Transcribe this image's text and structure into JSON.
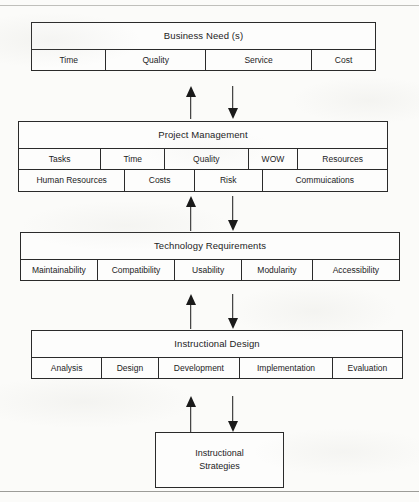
{
  "diagram": {
    "levels": [
      {
        "id": "business",
        "title": "Business Need (s)",
        "rows": [
          {
            "cells": [
              {
                "label": "Time",
                "width": 21.7
              },
              {
                "label": "Quality",
                "width": 29.0
              },
              {
                "label": "Service",
                "width": 31.0
              },
              {
                "label": "Cost",
                "width": 18.3
              }
            ]
          }
        ]
      },
      {
        "id": "project",
        "title": "Project Management",
        "rows": [
          {
            "cells": [
              {
                "label": "Tasks",
                "width": 22.4
              },
              {
                "label": "Time",
                "width": 17.3
              },
              {
                "label": "Quality",
                "width": 22.7
              },
              {
                "label": "WOW",
                "width": 13.5
              },
              {
                "label": "Resources",
                "width": 24.1
              }
            ]
          },
          {
            "cells": [
              {
                "label": "Human Resources",
                "width": 28.9
              },
              {
                "label": "Costs",
                "width": 18.9
              },
              {
                "label": "Risk",
                "width": 18.4
              },
              {
                "label": "Commuications",
                "width": 33.8
              }
            ]
          }
        ]
      },
      {
        "id": "technology",
        "title": "Technology Requirements",
        "rows": [
          {
            "cells": [
              {
                "label": "Maintainability",
                "width": 20.3
              },
              {
                "label": "Compatibility",
                "width": 20.5
              },
              {
                "label": "Usability",
                "width": 17.7
              },
              {
                "label": "Modularity",
                "width": 18.7
              },
              {
                "label": "Accessibility",
                "width": 22.8
              }
            ]
          }
        ]
      },
      {
        "id": "instructional",
        "title": "Instructional Design",
        "rows": [
          {
            "cells": [
              {
                "label": "Analysis",
                "width": 19.0
              },
              {
                "label": "Design",
                "width": 15.2
              },
              {
                "label": "Development",
                "width": 22.1
              },
              {
                "label": "Implementation",
                "width": 25.0
              },
              {
                "label": "Evaluation",
                "width": 18.7
              }
            ]
          }
        ]
      }
    ],
    "terminal_box": {
      "line1": "Instructional",
      "line2": "Strategies"
    },
    "connectors": [
      {
        "id": "business-project",
        "up_label": "feedback-up-arrow",
        "down_label": "flow-down-arrow"
      },
      {
        "id": "project-technology",
        "up_label": "feedback-up-arrow",
        "down_label": "flow-down-arrow"
      },
      {
        "id": "technology-instructional",
        "up_label": "feedback-up-arrow",
        "down_label": "flow-down-arrow"
      },
      {
        "id": "instructional-strategies",
        "up_label": "feedback-up-arrow",
        "down_label": "flow-down-arrow"
      }
    ],
    "colors": {
      "line": "#2a2a2a",
      "arrow": "#1a1a1a",
      "box_fill": "#fdfdfc",
      "page": "#fbfbf9"
    }
  }
}
